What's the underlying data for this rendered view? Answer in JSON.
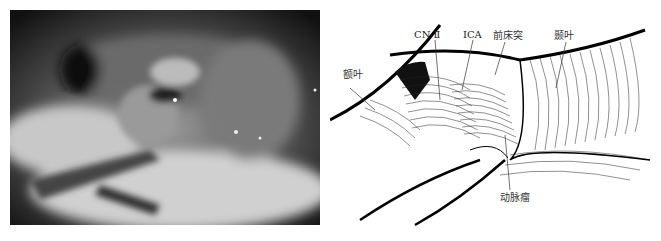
{
  "figure": {
    "left_panel": {
      "type": "intraoperative-photo",
      "description": "grayscale microscopic surgical view"
    },
    "right_panel": {
      "type": "line-illustration",
      "labels": {
        "cn2": "CN Ⅱ",
        "ica": "ICA",
        "anterior_clinoid": "前床突",
        "temporal_lobe": "颞叶",
        "frontal_lobe": "额叶",
        "aneurysm": "动脉瘤"
      }
    }
  }
}
